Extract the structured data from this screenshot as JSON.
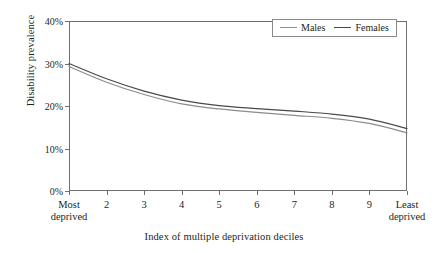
{
  "chart_data": {
    "type": "line",
    "title": "",
    "xlabel": "Index of multiple deprivation deciles",
    "ylabel": "Disability prevalence",
    "x": [
      1,
      2,
      3,
      4,
      5,
      6,
      7,
      8,
      9,
      10
    ],
    "categories": [
      "Most deprived",
      "2",
      "3",
      "4",
      "5",
      "6",
      "7",
      "8",
      "9",
      "Least deprived"
    ],
    "xtick_labels": [
      {
        "line1": "Most",
        "line2": "deprived"
      },
      {
        "line1": "2",
        "line2": ""
      },
      {
        "line1": "3",
        "line2": ""
      },
      {
        "line1": "4",
        "line2": ""
      },
      {
        "line1": "5",
        "line2": ""
      },
      {
        "line1": "6",
        "line2": ""
      },
      {
        "line1": "7",
        "line2": ""
      },
      {
        "line1": "8",
        "line2": ""
      },
      {
        "line1": "9",
        "line2": ""
      },
      {
        "line1": "Least",
        "line2": "deprived"
      }
    ],
    "ytick_labels": [
      "0%",
      "10%",
      "20%",
      "30%",
      "40%"
    ],
    "ytick_values": [
      0,
      10,
      20,
      30,
      40
    ],
    "ylim": [
      0,
      40
    ],
    "xlim": [
      1,
      10
    ],
    "grid": false,
    "legend_position": "top-right",
    "series": [
      {
        "name": "Males",
        "color": "#8c8c8c",
        "values": [
          29.3,
          25.6,
          22.7,
          20.5,
          19.3,
          18.5,
          17.8,
          17.1,
          15.9,
          13.7
        ]
      },
      {
        "name": "Females",
        "color": "#4a4a4a",
        "values": [
          30.0,
          26.4,
          23.5,
          21.4,
          20.1,
          19.4,
          18.8,
          18.1,
          16.9,
          14.7
        ]
      }
    ]
  },
  "legend": {
    "entries": [
      {
        "label": "Males"
      },
      {
        "label": "Females"
      }
    ]
  },
  "colors": {
    "axis": "#6f6f6f",
    "text": "#231f20",
    "males": "#8c8c8c",
    "females": "#4a4a4a",
    "background": "#ffffff"
  }
}
